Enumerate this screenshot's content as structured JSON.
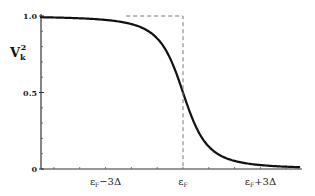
{
  "chart_data": {
    "type": "line",
    "title": "",
    "xlabel": "",
    "ylabel": "V_k^2",
    "ylabel_main": "V",
    "ylabel_sub": "k",
    "ylabel_sup": "2",
    "ylim": [
      0,
      1.0
    ],
    "xlim_delta_units": [
      -5.5,
      4.5
    ],
    "y_ticks": [
      {
        "value": 0,
        "label": "0"
      },
      {
        "value": 0.5,
        "label": "0.5"
      },
      {
        "value": 1.0,
        "label": "1.0"
      }
    ],
    "y_minor_step": 0.1,
    "x_ticks": [
      {
        "value": -3,
        "label": "εF−3Δ"
      },
      {
        "value": 0,
        "label": "εF"
      },
      {
        "value": 3,
        "label": "εF+3Δ"
      }
    ],
    "x_minor_step": 1,
    "series": [
      {
        "name": "BCS occupation V_k^2",
        "style": "solid",
        "description": "0.5*(1 - (e-εF)/sqrt((e-εF)^2+Δ^2)) smoothed step",
        "x": [
          -5.5,
          -4,
          -3,
          -2.5,
          -2,
          -1.5,
          -1,
          -0.5,
          0,
          0.5,
          1,
          1.5,
          2,
          2.5,
          3,
          4,
          4.5
        ],
        "y": [
          1.0,
          0.995,
          0.985,
          0.97,
          0.94,
          0.88,
          0.78,
          0.65,
          0.5,
          0.35,
          0.22,
          0.12,
          0.06,
          0.03,
          0.015,
          0.005,
          0.0
        ]
      },
      {
        "name": "Normal state step",
        "style": "dashed",
        "x": [
          -5.5,
          0,
          0
        ],
        "y": [
          1.0,
          1.0,
          0.0
        ]
      }
    ],
    "grid": false,
    "legend": "none"
  }
}
